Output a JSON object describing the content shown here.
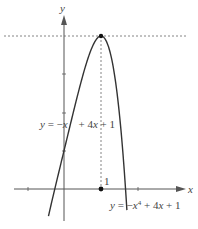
{
  "chart_data": {
    "type": "line",
    "title": "",
    "xlabel": "x",
    "ylabel": "y",
    "xlim": [
      -1.3,
      3.3
    ],
    "ylim": [
      -0.85,
      4.9
    ],
    "grid": false,
    "legend_position": "none",
    "series": [
      {
        "name": "y = -x^4 + 4x + 1",
        "label": "y = −x⁴ + 4x + 1",
        "formula": "-x^4 + 4x + 1",
        "x": [
          -0.4,
          -0.2,
          0,
          0.2,
          0.4,
          0.6,
          0.8,
          1.0,
          1.2,
          1.4,
          1.6,
          1.7
        ],
        "values": [
          -0.63,
          0.2,
          1.0,
          1.8,
          2.57,
          3.27,
          3.79,
          4.0,
          3.73,
          2.76,
          0.85,
          -0.55
        ]
      }
    ],
    "annotations": [
      {
        "type": "point",
        "x": 1,
        "y": 4,
        "label": "maximum"
      },
      {
        "type": "point",
        "x": 1,
        "y": 0,
        "label": "1"
      },
      {
        "type": "hline",
        "y": 4,
        "style": "dashed"
      },
      {
        "type": "vline",
        "x": 1,
        "style": "dashed",
        "from": 0,
        "to": 4
      },
      {
        "type": "text",
        "text": "y = −x⁴ + 4x + 1",
        "position": "upper-left"
      },
      {
        "type": "text",
        "text": "y = −x⁴ + 4x + 1",
        "position": "lower-right"
      }
    ],
    "x_ticks": [
      -1,
      0,
      1,
      2
    ],
    "y_ticks": [
      1,
      2,
      3,
      4
    ]
  },
  "labels": {
    "x_axis": "x",
    "y_axis": "y",
    "point_label": "1",
    "curve_label_left": "y = −x",
    "curve_label_left_rest": "+ 4x + 1",
    "curve_label_right_pre": "y = −x",
    "curve_label_right_exp": "4",
    "curve_label_right_rest": " + 4x + 1"
  },
  "colors": {
    "axis": "#555555",
    "curve": "#333333",
    "dashed": "#666666",
    "point": "#111111",
    "text": "#444444"
  }
}
